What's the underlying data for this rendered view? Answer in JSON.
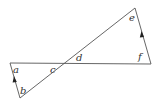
{
  "diagram": {
    "type": "geometry-angles",
    "colors": {
      "line": "#555555",
      "label": "#333333",
      "background": "#ffffff"
    },
    "labels": {
      "a": "a",
      "b": "b",
      "c": "c",
      "d": "d",
      "e": "e",
      "f": "f"
    },
    "points": {
      "left": [
        10,
        63
      ],
      "bottom": [
        20,
        98
      ],
      "cross": [
        65,
        63
      ],
      "top": [
        135,
        8
      ],
      "right": [
        151,
        64
      ]
    }
  }
}
